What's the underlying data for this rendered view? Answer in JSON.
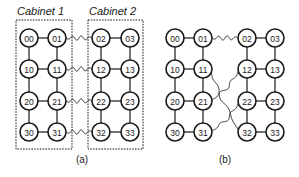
{
  "panel_a": {
    "caption": "(a)",
    "cabinets": [
      {
        "label": "Cabinet 1",
        "box": {
          "x": 16,
          "y": 20,
          "w": 56,
          "h": 129
        },
        "label_pos": {
          "x": 17,
          "y": 15
        }
      },
      {
        "label": "Cabinet 2",
        "box": {
          "x": 88,
          "y": 20,
          "w": 55,
          "h": 129
        },
        "label_pos": {
          "x": 89,
          "y": 15
        }
      }
    ],
    "columns_x": [
      29,
      57,
      101,
      130
    ],
    "rows_y": [
      38,
      69,
      101,
      132
    ],
    "caption_pos": {
      "x": 82,
      "y": 163
    },
    "wavy_links": [
      [
        "01",
        "02"
      ],
      [
        "11",
        "12"
      ],
      [
        "21",
        "22"
      ],
      [
        "31",
        "32"
      ]
    ]
  },
  "panel_b": {
    "caption": "(b)",
    "columns_x": [
      175,
      203,
      247,
      275
    ],
    "rows_y": [
      38,
      69,
      101,
      132
    ],
    "caption_pos": {
      "x": 225,
      "y": 163
    },
    "wavy_links": [
      [
        "01",
        "02"
      ],
      [
        "11",
        "32"
      ],
      [
        "21",
        "12"
      ],
      [
        "31",
        "22"
      ]
    ]
  },
  "node_labels": [
    [
      "00",
      "01",
      "02",
      "03"
    ],
    [
      "10",
      "11",
      "12",
      "13"
    ],
    [
      "20",
      "21",
      "22",
      "23"
    ],
    [
      "30",
      "31",
      "32",
      "33"
    ]
  ],
  "node_radius": 9,
  "mesh_edges_note": "Each panel: horizontal links within left pair (col0-col1) and right pair (col2-col3); vertical links down every column."
}
